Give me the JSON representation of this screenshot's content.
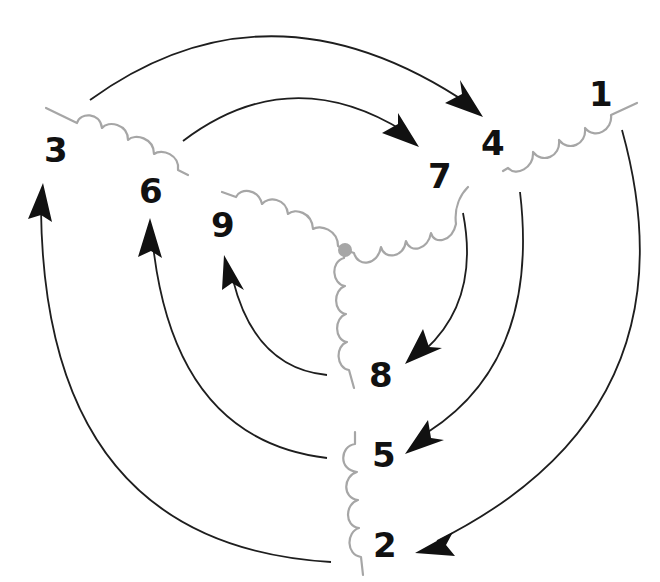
{
  "diagram": {
    "title": "",
    "colors": {
      "coil": "#a6a6a6",
      "arrow": "#1e1e1e",
      "label": "#111111",
      "junction": "#a6a6a6"
    },
    "leads": [
      {
        "id": "1",
        "label": "1"
      },
      {
        "id": "2",
        "label": "2"
      },
      {
        "id": "3",
        "label": "3"
      },
      {
        "id": "4",
        "label": "4"
      },
      {
        "id": "5",
        "label": "5"
      },
      {
        "id": "6",
        "label": "6"
      },
      {
        "id": "7",
        "label": "7"
      },
      {
        "id": "8",
        "label": "8"
      },
      {
        "id": "9",
        "label": "9"
      }
    ],
    "coils": [
      {
        "name": "outer-coil-3-6",
        "ends": [
          "3",
          "6"
        ]
      },
      {
        "name": "outer-coil-1-4",
        "ends": [
          "1",
          "4"
        ]
      },
      {
        "name": "outer-coil-5-2",
        "ends": [
          "5",
          "2"
        ]
      },
      {
        "name": "wye-coil-9",
        "ends": [
          "9",
          "center"
        ]
      },
      {
        "name": "wye-coil-7",
        "ends": [
          "7",
          "center"
        ]
      },
      {
        "name": "wye-coil-8",
        "ends": [
          "8",
          "center"
        ]
      }
    ],
    "arrows": [
      {
        "from": "3",
        "to": "4"
      },
      {
        "from": "6",
        "to": "7"
      },
      {
        "from": "7",
        "to": "8"
      },
      {
        "from": "1",
        "to": "2"
      },
      {
        "from": "4",
        "to": "5"
      },
      {
        "from": "8",
        "to": "9"
      },
      {
        "from": "5",
        "to": "6"
      },
      {
        "from": "2",
        "to": "3"
      }
    ]
  }
}
